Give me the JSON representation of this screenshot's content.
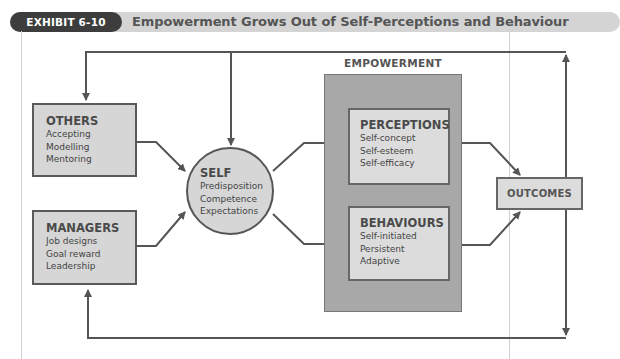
{
  "header": {
    "exhibit_label": "EXHIBIT 6-10",
    "title": "Empowerment Grows Out of Self-Perceptions and Behaviour"
  },
  "diagram": {
    "others": {
      "title": "OTHERS",
      "items": [
        "Accepting",
        "Modelling",
        "Mentoring"
      ]
    },
    "managers": {
      "title": "MANAGERS",
      "items": [
        "Job designs",
        "Goal reward",
        "Leadership"
      ]
    },
    "self": {
      "title": "SELF",
      "items": [
        "Predisposition",
        "Competence",
        "Expectations"
      ]
    },
    "empowerment": {
      "label": "EMPOWERMENT",
      "perceptions": {
        "title": "PERCEPTIONS",
        "items": [
          "Self-concept",
          "Self-esteem",
          "Self-efficacy"
        ]
      },
      "behaviours": {
        "title": "BEHAVIOURS",
        "items": [
          "Self-initiated",
          "Persistent",
          "Adaptive"
        ]
      }
    },
    "outcomes": {
      "title": "OUTCOMES"
    },
    "connections": [
      {
        "from": "OTHERS",
        "to": "SELF"
      },
      {
        "from": "MANAGERS",
        "to": "SELF"
      },
      {
        "from": "SELF",
        "to": "PERCEPTIONS"
      },
      {
        "from": "SELF",
        "to": "BEHAVIOURS"
      },
      {
        "from": "PERCEPTIONS",
        "to": "BEHAVIOURS"
      },
      {
        "from": "PERCEPTIONS",
        "to": "OUTCOMES"
      },
      {
        "from": "BEHAVIOURS",
        "to": "OUTCOMES"
      },
      {
        "from": "OUTCOMES",
        "to": "OTHERS",
        "via": "top feedback loop"
      },
      {
        "from": "OUTCOMES",
        "to": "SELF",
        "via": "top feedback loop"
      },
      {
        "from": "OUTCOMES",
        "to": "MANAGERS",
        "via": "bottom feedback loop"
      }
    ]
  },
  "colors": {
    "tag_bg": "#3d3d3d",
    "header_bar": "#d4d4d4",
    "box_fill": "#d6d6d6",
    "empowerment_fill": "#a8a8a8",
    "line": "#555555"
  }
}
